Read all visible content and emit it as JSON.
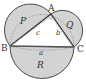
{
  "figure": {
    "vertices": {
      "A": "A",
      "B": "B",
      "C": "C"
    },
    "sides": {
      "a": "a",
      "b": "b",
      "c": "c"
    },
    "regions": {
      "P": "P",
      "Q": "Q",
      "R": "R"
    },
    "colors": {
      "fill": "#d3d3d3",
      "stroke": "#4a4a4a",
      "dashed": "#8a8a8a",
      "background": "#ffffff"
    }
  }
}
